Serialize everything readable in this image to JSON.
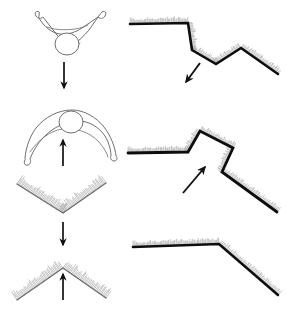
{
  "figure": {
    "title": "Concave and convex surface perception diagram",
    "background_color": "#ffffff",
    "ink_color": "#111111",
    "outline_color": "#5a5a5a",
    "hatch_color": "#8d8d8d",
    "width": 287,
    "height": 311
  },
  "panels": [
    {
      "id": "body-pose-concave",
      "label": "Person with arms raised in a V, viewed from above",
      "column": "left",
      "row": 1,
      "arrow": {
        "name": "down-arrow",
        "direction": "down",
        "symbol": "↓",
        "x": 64,
        "y1": 62,
        "y2": 88
      }
    },
    {
      "id": "body-pose-convex",
      "label": "Person with arms arched downward, viewed from above",
      "column": "left",
      "row": 2,
      "arrow": {
        "name": "up-arrow",
        "direction": "up",
        "symbol": "↑",
        "x": 63,
        "y1": 166,
        "y2": 140
      }
    },
    {
      "id": "abstract-valley",
      "label": "Hatched V shape, valley / concave fold",
      "column": "left",
      "row": 3,
      "arrow": {
        "name": "down-arrow",
        "direction": "down",
        "symbol": "↓",
        "x": 63,
        "y1": 222,
        "y2": 245
      }
    },
    {
      "id": "abstract-ridge",
      "label": "Hatched inverted V shape, ridge / convex fold",
      "column": "left",
      "row": 4,
      "arrow": {
        "name": "up-arrow",
        "direction": "up",
        "symbol": "↑",
        "x": 63,
        "y1": 300,
        "y2": 274
      }
    },
    {
      "id": "profile-concave",
      "label": "Terrain profile with concave step, arrow points down-left",
      "column": "right",
      "row": 1,
      "arrow": {
        "name": "down-left-arrow",
        "direction": "down-left",
        "symbol": "↙",
        "x1": 200,
        "y1": 63,
        "x2": 186,
        "y2": 82
      }
    },
    {
      "id": "profile-convex",
      "label": "Terrain profile with convex peak, arrow points up-right",
      "column": "right",
      "row": 2,
      "arrow": {
        "name": "up-right-arrow",
        "direction": "up-right",
        "symbol": "↗",
        "x1": 183,
        "y1": 193,
        "x2": 205,
        "y2": 167
      }
    },
    {
      "id": "profile-slope",
      "label": "Terrain profile with single convex break of slope",
      "column": "right",
      "row": 3,
      "arrow": null
    }
  ],
  "shapes": {
    "abstract_valley": {
      "points": "17,184 63,213 106,183",
      "hatch_side": "above"
    },
    "abstract_ridge": {
      "points": "17,300 63,268 106,298",
      "hatch_side": "above"
    },
    "profile_concave": {
      "points": "130,24 188,23 192,50 216,64 241,48 278,74",
      "hatch_side": "above"
    },
    "profile_convex": {
      "points": "128,153 188,152 200,131 233,148 222,172 277,212",
      "hatch_side": "above"
    },
    "profile_slope": {
      "points": "133,247 219,244 278,295",
      "hatch_side": "above"
    }
  },
  "figures": {
    "pose_concave": {
      "head": {
        "cx": 67,
        "cy": 44,
        "rx": 12,
        "ry": 11
      },
      "arms_outline": "M 39,12 C 36,10 34,13 36,16 C 38,19 41,19 43,17 L 57,35 C 61,40 66,42 68,45 L 70,50 L 74,45 C 78,41 84,36 89,30 L 98,17 C 100,19 103,19 105,16 C 107,13 105,10 102,12 C 100,14 99,16 98,17 L 82,28 C 76,32 68,35 60,34 C 52,33 44,27 39,18 Z",
      "shoulder_line": "M 47,27 C 56,31 78,31 88,25",
      "torso_line": "M 56,45 C 62,49 72,49 80,43"
    },
    "pose_convex": {
      "head": {
        "cx": 71,
        "cy": 122,
        "rx": 12,
        "ry": 11
      },
      "arms_outline": "M 25,160 C 23,163 25,166 28,165 C 31,164 31,161 30,159 C 34,148 42,137 52,130 C 62,123 76,119 86,122 C 96,125 104,132 108,142 C 110,147 111,152 111,156 C 110,158 111,161 114,161 C 117,161 118,158 116,156 C 115,147 111,136 104,127 C 96,117 84,110 72,110 C 58,110 45,117 36,128 C 30,136 26,147 25,158 Z",
      "inner_line": "M 30,152 C 38,140 50,131 62,129 C 74,127 90,132 99,142 C 104,148 107,153 108,157"
    }
  },
  "arrow_symbols": {
    "down": "↓",
    "up": "↑",
    "down_left": "↙",
    "up_right": "↗"
  }
}
